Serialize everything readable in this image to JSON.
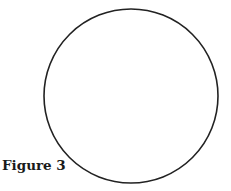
{
  "figure": {
    "caption": "Figure 3",
    "shape": "circle",
    "stroke_color": "#222222"
  }
}
